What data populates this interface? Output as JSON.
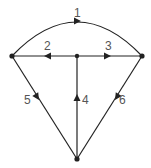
{
  "diagram": {
    "type": "directed-graph",
    "nodes": [
      {
        "id": "left",
        "x": 12,
        "y": 56
      },
      {
        "id": "center",
        "x": 77,
        "y": 56
      },
      {
        "id": "right",
        "x": 142,
        "y": 56
      },
      {
        "id": "bottom",
        "x": 77,
        "y": 159
      }
    ],
    "edges": [
      {
        "label": "1",
        "from": "left",
        "to": "right",
        "shape": "arc"
      },
      {
        "label": "2",
        "from": "center",
        "to": "left",
        "shape": "line"
      },
      {
        "label": "3",
        "from": "center",
        "to": "right",
        "shape": "line"
      },
      {
        "label": "4",
        "from": "bottom",
        "to": "center",
        "shape": "line"
      },
      {
        "label": "5",
        "from": "left",
        "to": "bottom",
        "shape": "line"
      },
      {
        "label": "6",
        "from": "right",
        "to": "bottom",
        "shape": "line"
      }
    ],
    "colors": {
      "line": "#222222",
      "label": "#555555"
    }
  }
}
